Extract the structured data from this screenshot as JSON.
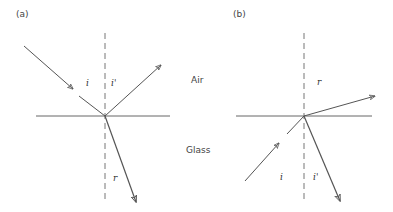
{
  "panels": {
    "a": {
      "label": "(a)",
      "incident_angle": "i",
      "reflected_angle": "i'",
      "refracted_angle": "r"
    },
    "b": {
      "label": "(b)",
      "incident_angle": "i",
      "reflected_angle": "i'",
      "refracted_angle": "r"
    }
  },
  "media": {
    "top": "Air",
    "bottom": "Glass"
  },
  "colors": {
    "line": "#555555",
    "text": "#444444"
  }
}
